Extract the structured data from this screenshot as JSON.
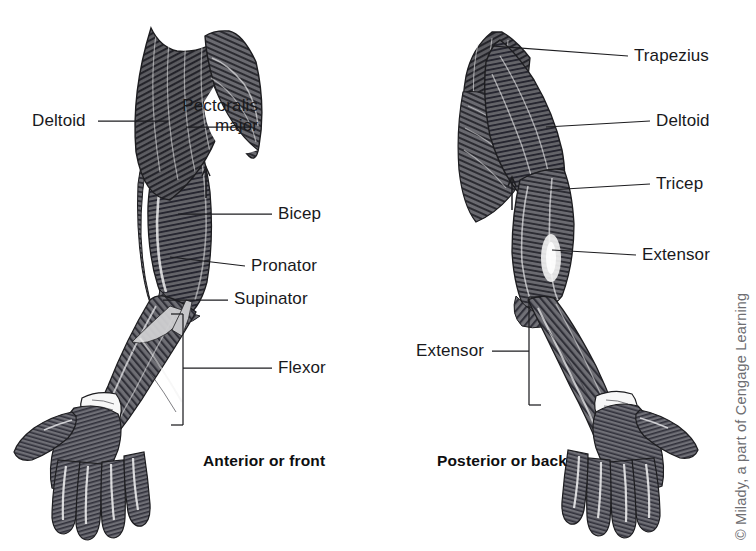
{
  "figure": {
    "line_color": "#1d1d20",
    "text_color": "#19191c",
    "credit_color": "#6e6e72",
    "background": "#ffffff"
  },
  "left_panel": {
    "caption": "Anterior or front",
    "labels": [
      {
        "name": "deltoid",
        "text": "Deltoid",
        "align": "left"
      },
      {
        "name": "pectoralis-major",
        "line1": "Pectoralis",
        "line2": "major",
        "align": "right"
      },
      {
        "name": "bicep",
        "text": "Bicep",
        "align": "left"
      },
      {
        "name": "pronator",
        "text": "Pronator",
        "align": "left"
      },
      {
        "name": "supinator",
        "text": "Supinator",
        "align": "left"
      },
      {
        "name": "flexor",
        "text": "Flexor",
        "align": "left"
      }
    ]
  },
  "right_panel": {
    "caption": "Posterior or back",
    "labels": [
      {
        "name": "trapezius",
        "text": "Trapezius",
        "align": "left"
      },
      {
        "name": "deltoid",
        "text": "Deltoid",
        "align": "left"
      },
      {
        "name": "tricep",
        "text": "Tricep",
        "align": "left"
      },
      {
        "name": "extensor-upper",
        "text": "Extensor",
        "align": "left"
      },
      {
        "name": "extensor-forearm",
        "text": "Extensor",
        "align": "right"
      }
    ]
  },
  "credit": {
    "text": "© Milady, a part of Cengage Learning"
  }
}
